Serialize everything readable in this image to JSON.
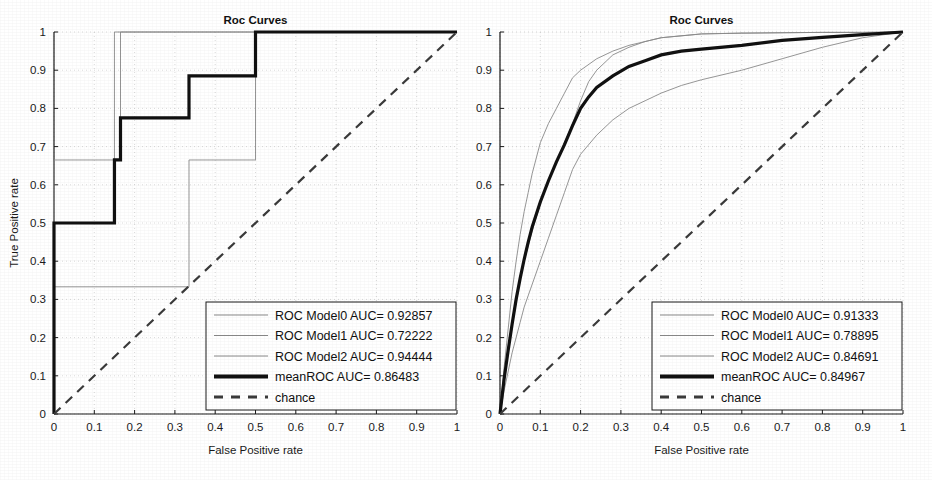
{
  "figure": {
    "width": 932,
    "height": 480,
    "background": "#ffffff",
    "ink": "#1a1a1a",
    "grid_color": "#c8c8c8",
    "thin_curve_color": "#8a8a8a",
    "mean_curve_color": "#111111",
    "chance_color": "#3a3a3a"
  },
  "panels": [
    {
      "id": "left",
      "title": "Roc Curves",
      "xlabel": "False Positive rate",
      "ylabel": "True Positive rate",
      "xticks": [
        "0",
        "0.1",
        "0.2",
        "0.3",
        "0.4",
        "0.5",
        "0.6",
        "0.7",
        "0.8",
        "0.9",
        "1"
      ],
      "yticks": [
        "0",
        "0.1",
        "0.2",
        "0.3",
        "0.4",
        "0.5",
        "0.6",
        "0.7",
        "0.8",
        "0.9",
        "1"
      ],
      "legend": [
        {
          "label": "ROC Model0 AUC= 0.92857",
          "style": "thin"
        },
        {
          "label": "ROC Model1 AUC= 0.72222",
          "style": "thin"
        },
        {
          "label": "ROC Model2 AUC= 0.94444",
          "style": "thin"
        },
        {
          "label": "meanROC AUC= 0.86483",
          "style": "thick"
        },
        {
          "label": "chance",
          "style": "dashed"
        }
      ]
    },
    {
      "id": "right",
      "title": "Roc Curves",
      "xlabel": "False Positive rate",
      "ylabel": "True Positive rate",
      "xticks": [
        "0",
        "0.1",
        "0.2",
        "0.3",
        "0.4",
        "0.5",
        "0.6",
        "0.7",
        "0.8",
        "0.9",
        "1"
      ],
      "yticks": [
        "0",
        "0.1",
        "0.2",
        "0.3",
        "0.4",
        "0.5",
        "0.6",
        "0.7",
        "0.8",
        "0.9",
        "1"
      ],
      "legend": [
        {
          "label": "ROC Model0 AUC= 0.91333",
          "style": "thin"
        },
        {
          "label": "ROC Model1 AUC= 0.78895",
          "style": "thin"
        },
        {
          "label": "ROC Model2 AUC= 0.84691",
          "style": "thin"
        },
        {
          "label": "meanROC AUC= 0.84967",
          "style": "thick"
        },
        {
          "label": "chance",
          "style": "dashed"
        }
      ]
    }
  ],
  "chart_data": [
    {
      "type": "line",
      "panel": "left",
      "title": "Roc Curves",
      "xlabel": "False Positive rate",
      "ylabel": "True Positive rate",
      "xlim": [
        0,
        1
      ],
      "ylim": [
        0,
        1
      ],
      "grid": true,
      "legend_position": "lower right",
      "series": [
        {
          "name": "ROC Model0",
          "auc": 0.92857,
          "style": "thin",
          "x": [
            0,
            0,
            0.165,
            0.165,
            1
          ],
          "y": [
            0,
            0.665,
            0.665,
            1,
            1
          ]
        },
        {
          "name": "ROC Model1",
          "auc": 0.72222,
          "style": "thin",
          "x": [
            0,
            0,
            0.335,
            0.335,
            0.5,
            0.5,
            1
          ],
          "y": [
            0,
            0.333,
            0.333,
            0.665,
            0.665,
            1,
            1
          ]
        },
        {
          "name": "ROC Model2",
          "auc": 0.94444,
          "style": "thin",
          "x": [
            0,
            0,
            0.15,
            0.15,
            1
          ],
          "y": [
            0,
            0.5,
            0.5,
            1,
            1
          ]
        },
        {
          "name": "meanROC",
          "auc": 0.86483,
          "style": "thick",
          "x": [
            0,
            0,
            0.15,
            0.15,
            0.165,
            0.165,
            0.335,
            0.335,
            0.5,
            0.5,
            1
          ],
          "y": [
            0,
            0.5,
            0.5,
            0.665,
            0.665,
            0.775,
            0.775,
            0.885,
            0.885,
            1,
            1
          ]
        },
        {
          "name": "chance",
          "style": "dashed",
          "x": [
            0,
            1
          ],
          "y": [
            0,
            1
          ]
        }
      ]
    },
    {
      "type": "line",
      "panel": "right",
      "title": "Roc Curves",
      "xlabel": "False Positive rate",
      "ylabel": "True Positive rate",
      "xlim": [
        0,
        1
      ],
      "ylim": [
        0,
        1
      ],
      "grid": true,
      "legend_position": "lower right",
      "series": [
        {
          "name": "ROC Model0",
          "auc": 0.91333,
          "style": "thin",
          "x": [
            0,
            0.01,
            0.02,
            0.03,
            0.04,
            0.05,
            0.06,
            0.07,
            0.08,
            0.09,
            0.1,
            0.12,
            0.14,
            0.16,
            0.18,
            0.2,
            0.24,
            0.28,
            0.32,
            0.36,
            0.4,
            0.5,
            0.6,
            0.7,
            0.8,
            0.9,
            1.0
          ],
          "y": [
            0,
            0.12,
            0.22,
            0.32,
            0.4,
            0.47,
            0.53,
            0.58,
            0.63,
            0.67,
            0.71,
            0.76,
            0.8,
            0.84,
            0.88,
            0.9,
            0.93,
            0.95,
            0.965,
            0.975,
            0.985,
            0.995,
            0.997,
            0.998,
            0.999,
            0.999,
            1.0
          ]
        },
        {
          "name": "ROC Model1",
          "auc": 0.78895,
          "style": "thin",
          "x": [
            0,
            0.01,
            0.02,
            0.03,
            0.04,
            0.05,
            0.06,
            0.08,
            0.1,
            0.12,
            0.14,
            0.16,
            0.18,
            0.2,
            0.24,
            0.28,
            0.32,
            0.36,
            0.4,
            0.45,
            0.5,
            0.6,
            0.7,
            0.8,
            0.9,
            1.0
          ],
          "y": [
            0,
            0.06,
            0.11,
            0.16,
            0.2,
            0.24,
            0.28,
            0.34,
            0.4,
            0.46,
            0.52,
            0.58,
            0.64,
            0.68,
            0.73,
            0.77,
            0.8,
            0.82,
            0.84,
            0.86,
            0.875,
            0.9,
            0.93,
            0.96,
            0.985,
            1.0
          ]
        },
        {
          "name": "ROC Model2",
          "auc": 0.84691,
          "style": "thin",
          "x": [
            0,
            0.01,
            0.02,
            0.03,
            0.04,
            0.05,
            0.06,
            0.08,
            0.1,
            0.12,
            0.14,
            0.16,
            0.18,
            0.2,
            0.22,
            0.24,
            0.28,
            0.32,
            0.36,
            0.4,
            0.5,
            0.6,
            0.7,
            0.8,
            0.9,
            1.0
          ],
          "y": [
            0,
            0.09,
            0.16,
            0.23,
            0.29,
            0.35,
            0.4,
            0.48,
            0.55,
            0.61,
            0.66,
            0.71,
            0.76,
            0.82,
            0.87,
            0.9,
            0.94,
            0.96,
            0.975,
            0.985,
            0.995,
            0.997,
            0.998,
            0.999,
            0.999,
            1.0
          ]
        },
        {
          "name": "meanROC",
          "auc": 0.84967,
          "style": "thick",
          "x": [
            0,
            0.01,
            0.02,
            0.03,
            0.04,
            0.05,
            0.06,
            0.07,
            0.08,
            0.1,
            0.12,
            0.14,
            0.16,
            0.18,
            0.2,
            0.22,
            0.24,
            0.28,
            0.32,
            0.36,
            0.4,
            0.45,
            0.5,
            0.6,
            0.7,
            0.8,
            0.9,
            1.0
          ],
          "y": [
            0,
            0.09,
            0.165,
            0.235,
            0.3,
            0.355,
            0.405,
            0.45,
            0.49,
            0.555,
            0.61,
            0.66,
            0.705,
            0.755,
            0.8,
            0.83,
            0.855,
            0.885,
            0.91,
            0.925,
            0.94,
            0.95,
            0.955,
            0.965,
            0.978,
            0.986,
            0.993,
            1.0
          ]
        },
        {
          "name": "chance",
          "style": "dashed",
          "x": [
            0,
            1
          ],
          "y": [
            0,
            1
          ]
        }
      ]
    }
  ]
}
